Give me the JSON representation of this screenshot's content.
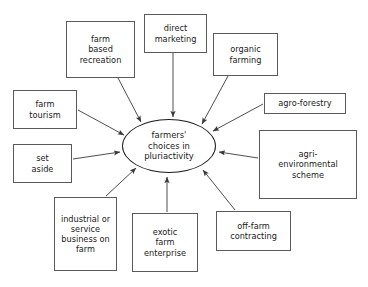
{
  "diagram": {
    "background_color": "#ffffff",
    "box_border_color": "#5a5a5a",
    "center_border_color": "#1c1c1c",
    "edge_color": "#3a3a3a",
    "text_color": "#1a1a1a",
    "center": {
      "id": "center-node",
      "name": "farmers-choices-ellipse",
      "label": "farmers'\nchoices in\npluriactivity",
      "x": 122,
      "y": 119,
      "width": 94,
      "height": 54,
      "font_size": 8.4
    },
    "nodes": [
      {
        "id": "farm-based-recreation",
        "name": "node-farm-based-recreation",
        "label": "farm\nbased\nrecreation",
        "x": 66,
        "y": 21,
        "width": 69,
        "height": 57,
        "font_size": 8.2
      },
      {
        "id": "direct-marketing",
        "name": "node-direct-marketing",
        "label": "direct\nmarketing",
        "x": 144,
        "y": 14,
        "width": 63,
        "height": 39,
        "font_size": 8.2
      },
      {
        "id": "organic-farming",
        "name": "node-organic-farming",
        "label": "organic\nfarming",
        "x": 213,
        "y": 33,
        "width": 65,
        "height": 43,
        "font_size": 8.2
      },
      {
        "id": "agro-forestry",
        "name": "node-agro-forestry",
        "label": "agro-forestry",
        "x": 264,
        "y": 93,
        "width": 82,
        "height": 21,
        "font_size": 8.2
      },
      {
        "id": "agri-environmental-scheme",
        "name": "node-agri-environmental-scheme",
        "label": "agri-\nenvironmental\nscheme",
        "x": 259,
        "y": 130,
        "width": 98,
        "height": 69,
        "font_size": 8.2
      },
      {
        "id": "off-farm-contracting",
        "name": "node-off-farm-contracting",
        "label": "off-farm\ncontracting",
        "x": 216,
        "y": 211,
        "width": 75,
        "height": 40,
        "font_size": 8.2
      },
      {
        "id": "exotic-farm-enterprise",
        "name": "node-exotic-farm-enterprise",
        "label": "exotic\nfarm\nenterprise",
        "x": 132,
        "y": 213,
        "width": 66,
        "height": 59,
        "font_size": 8.2
      },
      {
        "id": "industrial-or-service-business-on-farm",
        "name": "node-industrial-or-service-business-on-farm",
        "label": "industrial or\nservice\nbusiness on\nfarm",
        "x": 54,
        "y": 197,
        "width": 63,
        "height": 74,
        "font_size": 8.2
      },
      {
        "id": "set-aside",
        "name": "node-set-aside",
        "label": "set\naside",
        "x": 13,
        "y": 144,
        "width": 59,
        "height": 39,
        "font_size": 8.2
      },
      {
        "id": "farm-tourism",
        "name": "node-farm-tourism",
        "label": "farm\ntourism",
        "x": 13,
        "y": 90,
        "width": 64,
        "height": 39,
        "font_size": 8.2
      }
    ],
    "edges": [
      {
        "id": "edge-farm-based-recreation",
        "name": "arrow-farm-based-recreation-to-center",
        "from": "farm-based-recreation",
        "to": "center-node",
        "x1": 118,
        "y1": 78,
        "x2": 141,
        "y2": 122
      },
      {
        "id": "edge-direct-marketing",
        "name": "arrow-direct-marketing-to-center",
        "from": "direct-marketing",
        "to": "center-node",
        "x1": 173,
        "y1": 53,
        "x2": 173,
        "y2": 117
      },
      {
        "id": "edge-organic-farming",
        "name": "arrow-organic-farming-to-center",
        "from": "organic-farming",
        "to": "center-node",
        "x1": 228,
        "y1": 76,
        "x2": 202,
        "y2": 124
      },
      {
        "id": "edge-agro-forestry",
        "name": "arrow-agro-forestry-to-center",
        "from": "agro-forestry",
        "to": "center-node",
        "x1": 263,
        "y1": 104,
        "x2": 213,
        "y2": 131
      },
      {
        "id": "edge-agri-environmental-scheme",
        "name": "arrow-agri-environmental-scheme-to-center",
        "from": "agri-environmental-scheme",
        "to": "center-node",
        "x1": 258,
        "y1": 158,
        "x2": 219,
        "y2": 152
      },
      {
        "id": "edge-off-farm-contracting",
        "name": "arrow-off-farm-contracting-to-center",
        "from": "off-farm-contracting",
        "to": "center-node",
        "x1": 235,
        "y1": 210,
        "x2": 203,
        "y2": 170
      },
      {
        "id": "edge-exotic-farm-enterprise",
        "name": "arrow-exotic-farm-enterprise-to-center",
        "from": "exotic-farm-enterprise",
        "to": "center-node",
        "x1": 167,
        "y1": 212,
        "x2": 167,
        "y2": 177
      },
      {
        "id": "edge-industrial-or-service-business-on-farm",
        "name": "arrow-industrial-business-to-center",
        "from": "industrial-or-service-business-on-farm",
        "to": "center-node",
        "x1": 106,
        "y1": 196,
        "x2": 136,
        "y2": 168
      },
      {
        "id": "edge-set-aside",
        "name": "arrow-set-aside-to-center",
        "from": "set-aside",
        "to": "center-node",
        "x1": 73,
        "y1": 159,
        "x2": 120,
        "y2": 152
      },
      {
        "id": "edge-farm-tourism",
        "name": "arrow-farm-tourism-to-center",
        "from": "farm-tourism",
        "to": "center-node",
        "x1": 78,
        "y1": 110,
        "x2": 124,
        "y2": 135
      }
    ]
  }
}
